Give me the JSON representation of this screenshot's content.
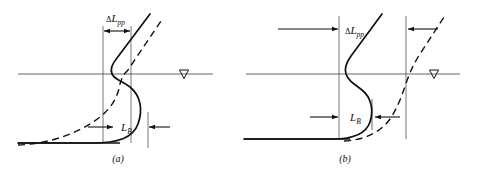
{
  "figure": {
    "name": "hull-profile-comparison-figure",
    "background": "#ffffff",
    "ink_color": "#111111",
    "hairline_color": "#555555",
    "width": 478,
    "height": 171
  },
  "panels": [
    {
      "id": "a",
      "caption": "(a)",
      "caption_x": 118,
      "caption_y": 160,
      "waterline": {
        "label": "waterline",
        "y": 74,
        "x_start": 18,
        "x_end": 213
      },
      "water_table_symbol": {
        "name": "water-table-triangle",
        "x": 184,
        "y": 74,
        "size": 9
      },
      "baseline": {
        "y": 143,
        "x_start": 18,
        "x_end": 120
      },
      "dimension_dlpp": {
        "label_delta": "Δ",
        "label_main": "L",
        "label_sub": "pp",
        "label_x": 106,
        "label_y": 21,
        "arrow_y": 31,
        "left_x": 103,
        "right_x": 131,
        "style": "outward-double-arrow",
        "tick_top": 26,
        "tick_bottom": 143
      },
      "dimension_lb": {
        "label_main": "L",
        "label_sub": "B",
        "label_x": 121,
        "label_y": 131,
        "arrow_y": 127,
        "left_x": 88,
        "right_x": 170,
        "inner_left_x": 114,
        "inner_right_x": 148,
        "style": "inward-double-arrow"
      },
      "solid_profile": "M 18 143 L 92 143 C 118 143 133 138 138 124 C 143 110 141 96 130 87 C 121 80 115 80 112 74 C 110 69 112 64 117 58 L 150 14",
      "dashed_profile": "M 18 145 C 45 144 72 136 93 122 C 112 110 118 96 120 84 C 122 77 124 74 128 70 L 163 18"
    },
    {
      "id": "b",
      "caption": "(b)",
      "caption_x": 345,
      "caption_y": 160,
      "waterline": {
        "label": "waterline",
        "y": 74,
        "x_start": 246,
        "x_end": 460
      },
      "water_table_symbol": {
        "name": "water-table-triangle",
        "x": 434,
        "y": 74,
        "size": 9
      },
      "baseline": {
        "y": 139,
        "x_start": 244,
        "x_end": 350
      },
      "dimension_dlpp": {
        "label_delta": "Δ",
        "label_main": "L",
        "label_sub": "pp",
        "label_x": 345,
        "label_y": 33,
        "arrow_y": 29,
        "left_arrow_from": 278,
        "left_arrow_to": 339,
        "right_arrow_from": 438,
        "right_arrow_to": 408,
        "tick_left_x": 339,
        "tick_right_x": 406,
        "tick_top": 16,
        "tick_bottom": 139
      },
      "dimension_lb": {
        "label_main": "L",
        "label_sub": "B",
        "label_x": 354,
        "label_y": 121,
        "arrow_y": 117,
        "left_arrow_from": 310,
        "left_arrow_to": 339,
        "right_arrow_from": 400,
        "right_arrow_to": 374,
        "tick_x": 372,
        "tick_top": 99,
        "tick_bottom": 130
      },
      "solid_profile": "M 244 139 L 333 139 C 352 139 366 134 370 122 C 374 110 371 97 362 90 C 353 83 348 80 346 74 C 344 68 346 63 351 56 L 382 14",
      "dashed_profile": "M 344 141 C 366 140 383 131 392 116 C 401 101 404 88 408 78 C 411 70 414 64 418 57 L 446 14"
    }
  ],
  "legend_notes": {
    "solid_meaning": "solid-profile-curve",
    "dashed_meaning": "dashed-profile-curve"
  }
}
